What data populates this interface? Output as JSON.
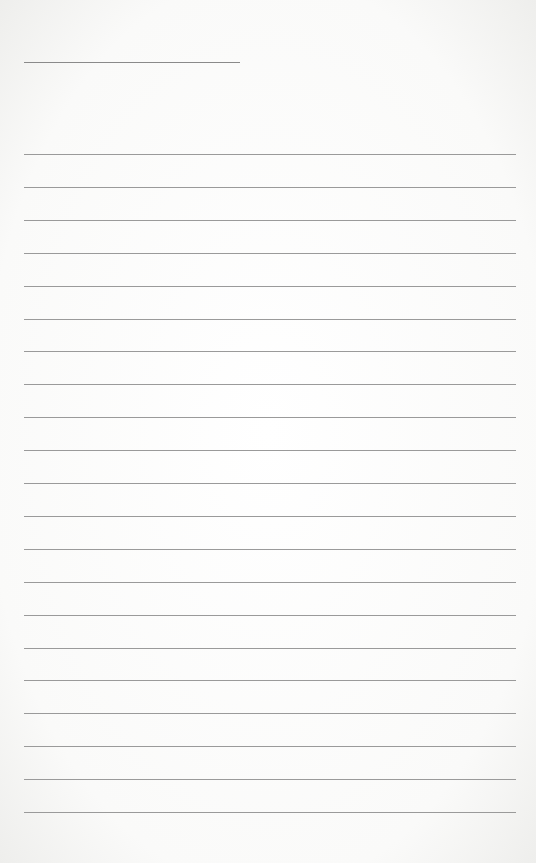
{
  "page": {
    "type": "lined-paper",
    "background_color": "#fbfbfa",
    "line_color": "#9a9a9a"
  },
  "title_line": {
    "x": 24,
    "y": 62,
    "width": 216
  },
  "rules": {
    "x": 24,
    "width": 492,
    "start_y": 154,
    "spacing": 32.9,
    "count": 21
  }
}
